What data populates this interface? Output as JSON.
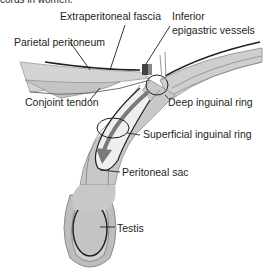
{
  "caption": "cords in women.",
  "labels": {
    "extraperitoneal_fascia": "Extraperitoneal fascia",
    "inferior_epigastric_line1": "Inferior",
    "inferior_epigastric_line2": "epigastric vessels",
    "parietal_peritoneum": "Parietal peritoneum",
    "conjoint_tendon": "Conjoint tendon",
    "deep_inguinal_ring": "Deep inguinal ring",
    "superficial_inguinal_ring": "Superficial inguinal ring",
    "peritoneal_sac": "Peritoneal sac",
    "testis": "Testis"
  },
  "colors": {
    "tissue_light": "#d9d9d9",
    "tissue_mid": "#bdbdbd",
    "tissue_dark": "#8c8c8c",
    "arrow": "#7a7a7a",
    "line": "#231f20"
  }
}
